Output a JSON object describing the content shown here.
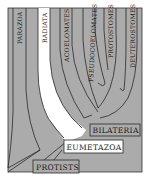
{
  "diagram": {
    "type": "phylogenetic-tree",
    "colors": {
      "background": "#ababab",
      "branch_line": "#2a2a2a",
      "radiata_band": "#ffffff",
      "label_box": "#ffffff",
      "frame": "#333333"
    },
    "branches": [
      {
        "label": "PARAZOA",
        "display": "Parazoa"
      },
      {
        "label": "RADIATA",
        "display": "Radiata"
      },
      {
        "label": "ACOELOMATES",
        "display": "Acoelomates"
      },
      {
        "label": "PSEUDOCOELOMATES",
        "display": "Pseudocoelomates"
      },
      {
        "label": "PROTOSTOMES",
        "display": "Protostomes"
      },
      {
        "label": "DEUTEROSTOMES",
        "display": "Deuterostomes"
      }
    ],
    "nodes": {
      "bilateria": "BILATERIA",
      "eumetazoa": "EUMETAZOA",
      "protists": "PROTISTS"
    }
  }
}
